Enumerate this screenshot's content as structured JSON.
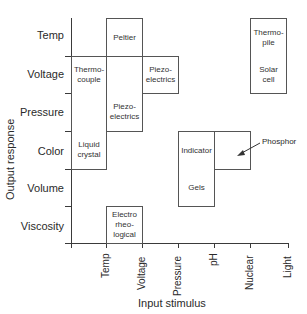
{
  "diagram": {
    "x_axis_title": "Input stimulus",
    "y_axis_title": "Output response",
    "rows": [
      "Temp",
      "Voltage",
      "Pressure",
      "Color",
      "Volume",
      "Viscosity"
    ],
    "columns": [
      "Temp",
      "Voltage",
      "Pressure",
      "pH",
      "Nuclear",
      "Light"
    ],
    "cells": {
      "peltier": "Peltier",
      "thermocouple_1": "Thermo-",
      "thermocouple_2": "couple",
      "piezo_v_1": "Piezo-",
      "piezo_v_2": "electrics",
      "piezo_p_1": "Piezo-",
      "piezo_p_2": "electrics",
      "liquid_crystal_1": "Liquid",
      "liquid_crystal_2": "crystal",
      "electro_1": "Electro",
      "electro_2": "rheo-",
      "electro_3": "logical",
      "indicator": "Indicator",
      "gels": "Gels",
      "thermopile_1": "Thermo-",
      "thermopile_2": "pile",
      "solar_1": "Solar",
      "solar_2": "cell"
    },
    "callout": {
      "phosphor": "Phosphor"
    }
  }
}
